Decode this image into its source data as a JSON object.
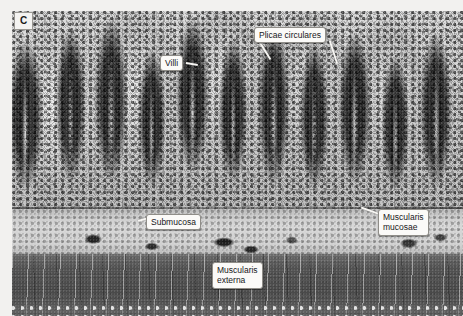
{
  "figure": {
    "panel_letter": "C",
    "modality": "light-micrograph-grayscale",
    "width_px": 463,
    "height_px": 316
  },
  "annotations": [
    {
      "id": "plicae",
      "label": "Plicae circulares",
      "lines": 2,
      "leaders": 2
    },
    {
      "id": "villi",
      "label": "Villi",
      "lines": 1,
      "leaders": 1
    },
    {
      "id": "submucosa",
      "label": "Submucosa",
      "lines": 1,
      "leaders": 1
    },
    {
      "id": "mucosae",
      "label": "Muscularis\nmucosae",
      "lines": 2,
      "leaders": 1
    },
    {
      "id": "externa",
      "label": "Muscularis\nexterna",
      "lines": 2,
      "leaders": 0
    }
  ],
  "labels": {
    "plicae_circulares": "Plicae circulares",
    "villi": "Villi",
    "submucosa": "Submucosa",
    "muscularis_mucosae": "Muscularis\nmucosae",
    "muscularis_externa": "Muscularis\nexterna"
  },
  "colors": {
    "callout_background": "#fbfaf8",
    "callout_border": "#8f8d88",
    "callout_text": "#17171a",
    "leader_line": "#f7f6f3",
    "plate_background": "#8e8d89",
    "page_background": "#f2f1ef",
    "panel_letter_background": "#f4f3f1"
  },
  "tissue_layers": [
    {
      "name": "Plicae circulares / villi (mucosa)",
      "tone": "dark"
    },
    {
      "name": "Submucosa",
      "tone": "pale"
    },
    {
      "name": "Muscularis mucosae",
      "tone": "thin-dark-line"
    },
    {
      "name": "Muscularis externa",
      "tone": "mid-dark-band"
    }
  ]
}
